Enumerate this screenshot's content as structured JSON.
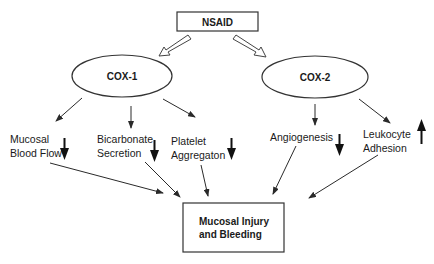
{
  "diagram": {
    "source": {
      "label": "NSAID"
    },
    "enzymes": [
      {
        "id": "cox1",
        "label": "COX-1"
      },
      {
        "id": "cox2",
        "label": "COX-2"
      }
    ],
    "effects": [
      {
        "id": "mucosal-blood-flow",
        "lines": [
          "Mucosal",
          "Blood Flow"
        ],
        "parent": "cox1",
        "direction": "down"
      },
      {
        "id": "bicarbonate-secretion",
        "lines": [
          "Bicarbonate",
          "Secretion"
        ],
        "parent": "cox1",
        "direction": "down"
      },
      {
        "id": "platelet-aggregation",
        "lines": [
          "Platelet",
          "Aggregaton"
        ],
        "parent": "cox1",
        "direction": "down"
      },
      {
        "id": "angiogenesis",
        "lines": [
          "Angiogenesis"
        ],
        "parent": "cox2",
        "direction": "down"
      },
      {
        "id": "leukocyte-adhesion",
        "lines": [
          "Leukocyte",
          "Adhesion"
        ],
        "parent": "cox2",
        "direction": "up"
      }
    ],
    "outcome": {
      "lines": [
        "Mucosal Injury",
        "and Bleeding"
      ]
    },
    "colors": {
      "stroke": "#333333",
      "text": "#1a1a1a",
      "background": "#ffffff"
    }
  }
}
